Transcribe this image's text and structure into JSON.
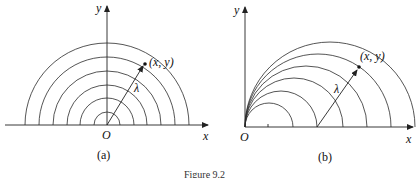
{
  "figure": {
    "caption": "Figure 9.2",
    "panels": [
      {
        "id": "a",
        "sublabel": "(a)",
        "x_axis_label": "x",
        "y_axis_label": "y",
        "origin_label": "O",
        "point_label": "(x, y)",
        "vector_label": "λ",
        "description": "Concentric semicircles centered at origin O; vector λ from O to point (x, y)"
      },
      {
        "id": "b",
        "sublabel": "(b)",
        "x_axis_label": "x",
        "y_axis_label": "y",
        "origin_label": "O",
        "point_label": "(x, y)",
        "vector_label": "λ",
        "description": "Semicircles all passing through origin O with centers on x-axis; vector λ from a center to point (x, y)"
      }
    ]
  }
}
